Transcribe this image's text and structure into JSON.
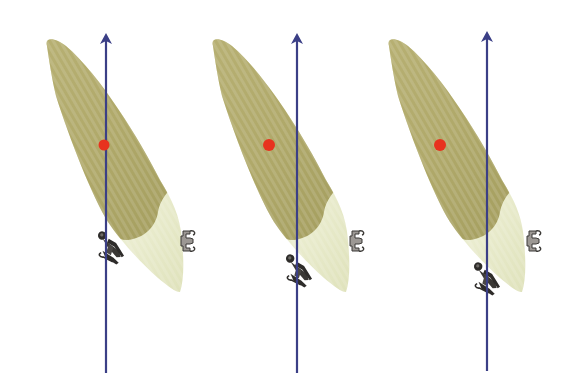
{
  "diagram": {
    "type": "orthodontic-force-diagram",
    "background": "#ffffff",
    "colors": {
      "root": "#b3ac6c",
      "root_dark": "#9e9858",
      "crown": "#e6e8c6",
      "crown_light": "#f2f3de",
      "force_line": "#3b3f86",
      "center_of_resistance": "#e8321e",
      "bracket": "#2e2c2a",
      "bracket_light": "#7a7670"
    },
    "panels": [
      {
        "id": "panel-1",
        "tooth_offset_x": 0,
        "center_of_resistance": {
          "x": 104,
          "y": 145
        },
        "force_line": {
          "x": 106,
          "y_top": 34,
          "y_bottom": 373
        },
        "labial_bracket": {
          "x": 110,
          "y": 243
        },
        "lingual_bracket": {
          "x": 187,
          "y": 241
        }
      },
      {
        "id": "panel-2",
        "tooth_offset_x": 167,
        "center_of_resistance": {
          "x": 269,
          "y": 145
        },
        "force_line": {
          "x": 297,
          "y_top": 34,
          "y_bottom": 373
        },
        "labial_bracket": {
          "x": 296,
          "y": 266
        },
        "lingual_bracket": {
          "x": 356,
          "y": 241
        }
      },
      {
        "id": "panel-3",
        "tooth_offset_x": 342,
        "center_of_resistance": {
          "x": 440,
          "y": 145
        },
        "force_line": {
          "x": 487,
          "y_top": 32,
          "y_bottom": 371
        },
        "labial_bracket": {
          "x": 484,
          "y": 274
        },
        "lingual_bracket": {
          "x": 533,
          "y": 241
        }
      }
    ]
  }
}
